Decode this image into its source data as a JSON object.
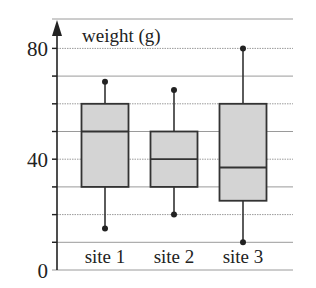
{
  "chart_data": {
    "type": "boxplot",
    "title": "",
    "ylabel": "weight (g)",
    "xlabel": "",
    "ylim": [
      0,
      80
    ],
    "yticks": [
      0,
      40,
      80
    ],
    "grid": true,
    "grid_step": 10,
    "categories": [
      "site 1",
      "site 2",
      "site 3"
    ],
    "series": [
      {
        "name": "site 1",
        "min": 15,
        "q1": 30,
        "median": 50,
        "q3": 60,
        "max": 68
      },
      {
        "name": "site 2",
        "min": 20,
        "q1": 30,
        "median": 40,
        "q3": 50,
        "max": 65
      },
      {
        "name": "site 3",
        "min": 10,
        "q1": 25,
        "median": 37,
        "q3": 60,
        "max": 80
      }
    ],
    "box_fill": "#d4d4d4",
    "line_color": "#333333"
  },
  "labels": {
    "ylabel": "weight (g)",
    "ytick_0": "0",
    "ytick_40": "40",
    "ytick_80": "80",
    "cat_1": "site 1",
    "cat_2": "site 2",
    "cat_3": "site 3"
  }
}
